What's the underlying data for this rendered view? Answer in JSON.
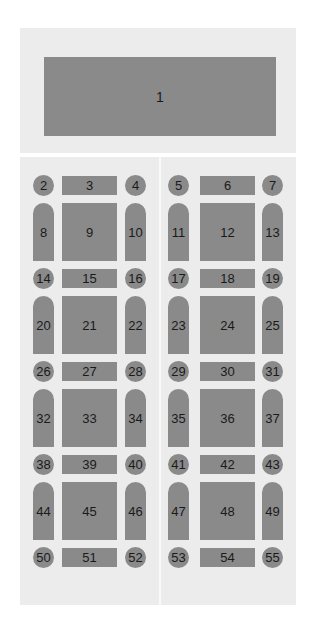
{
  "diagram": {
    "title_block": {
      "label": "1"
    },
    "layout": {
      "left_cols": {
        "circle_a": 33,
        "rect": 62,
        "circle_b": 125
      },
      "right_cols": {
        "circle_a": 168,
        "rect": 200,
        "circle_b": 262
      },
      "small_rows_top": [
        175,
        268,
        361,
        454,
        547
      ],
      "big_rows_top": [
        203,
        296,
        389,
        482
      ]
    },
    "bands": [
      {
        "left": [
          "2",
          "3",
          "4"
        ],
        "right": [
          "5",
          "6",
          "7"
        ]
      },
      {
        "left": [
          "8",
          "9",
          "10"
        ],
        "right": [
          "11",
          "12",
          "13"
        ]
      },
      {
        "left": [
          "14",
          "15",
          "16"
        ],
        "right": [
          "17",
          "18",
          "19"
        ]
      },
      {
        "left": [
          "20",
          "21",
          "22"
        ],
        "right": [
          "23",
          "24",
          "25"
        ]
      },
      {
        "left": [
          "26",
          "27",
          "28"
        ],
        "right": [
          "29",
          "30",
          "31"
        ]
      },
      {
        "left": [
          "32",
          "33",
          "34"
        ],
        "right": [
          "35",
          "36",
          "37"
        ]
      },
      {
        "left": [
          "38",
          "39",
          "40"
        ],
        "right": [
          "41",
          "42",
          "43"
        ]
      },
      {
        "left": [
          "44",
          "45",
          "46"
        ],
        "right": [
          "47",
          "48",
          "49"
        ]
      },
      {
        "left": [
          "50",
          "51",
          "52"
        ],
        "right": [
          "53",
          "54",
          "55"
        ]
      }
    ],
    "colors": {
      "panel": "#ececec",
      "shape": "#8a8a8a",
      "divider": "#f9f9f9",
      "text": "#1a1a1a"
    }
  }
}
